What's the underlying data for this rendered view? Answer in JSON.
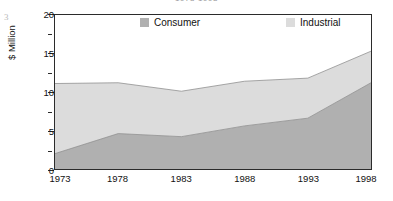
{
  "figure_number": "3",
  "chart_data": {
    "type": "area",
    "stacked": true,
    "title": "1973-1998",
    "xlabel": "",
    "ylabel": "$ Million",
    "categories": [
      "1973",
      "1978",
      "1983",
      "1988",
      "1993",
      "1998"
    ],
    "x": [
      1973,
      1978,
      1983,
      1988,
      1993,
      1998
    ],
    "xlim": [
      1973,
      1998
    ],
    "ylim": [
      0,
      20
    ],
    "y_ticks": [
      0,
      5,
      10,
      15,
      20
    ],
    "y_tick_labels": [
      "0",
      "5",
      "10",
      "15",
      "20"
    ],
    "y_minor_ticks": [
      2.5,
      7.5,
      12.5,
      17.5
    ],
    "grid": false,
    "legend_position": "top-inside",
    "series": [
      {
        "name": "Consumer",
        "color": "#b0b0b0",
        "values": [
          2.0,
          4.6,
          4.2,
          5.6,
          6.6,
          11.2
        ]
      },
      {
        "name": "Industrial",
        "color": "#dcdcdc",
        "values": [
          9.1,
          6.6,
          5.9,
          5.8,
          5.2,
          4.1
        ]
      }
    ],
    "totals": [
      11.1,
      11.2,
      10.1,
      11.4,
      11.8,
      15.3
    ],
    "legend": [
      {
        "label": "Consumer",
        "color": "#b0b0b0"
      },
      {
        "label": "Industrial",
        "color": "#dcdcdc"
      }
    ]
  },
  "colors": {
    "consumer": "#b0b0b0",
    "industrial": "#dcdcdc",
    "axis": "#2b2b2b",
    "text": "#111111",
    "background": "#ffffff"
  }
}
